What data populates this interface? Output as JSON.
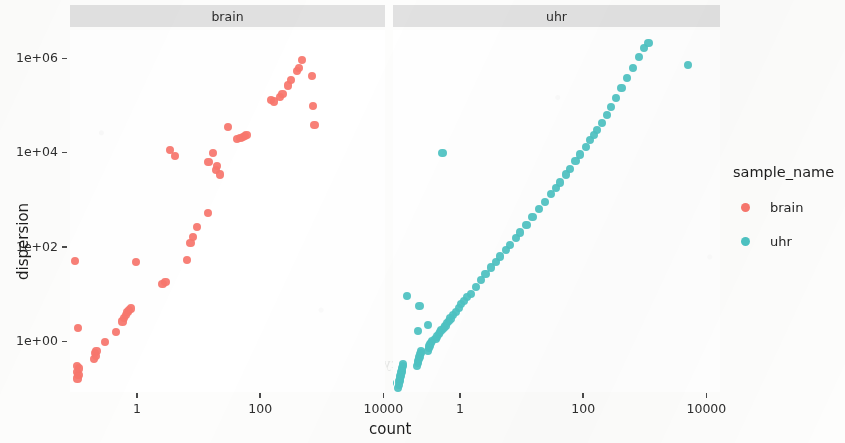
{
  "chart_data": {
    "type": "scatter",
    "title": "",
    "xlabel": "count",
    "ylabel": "dispersion",
    "xscale": "log10",
    "yscale": "log10",
    "xlim": [
      0.02,
      40000
    ],
    "ylim": [
      0.04,
      4000000
    ],
    "grid": false,
    "facet_by": "sample_name",
    "legend_title": "sample_name",
    "legend_position": "right",
    "x_ticks": [
      "1",
      "100",
      "10000"
    ],
    "x_tick_values": [
      1,
      100,
      10000
    ],
    "y_ticks": [
      "1e+00",
      "1e+02",
      "1e+04",
      "1e+06"
    ],
    "y_tick_values": [
      1,
      100,
      10000,
      1000000
    ],
    "colors": {
      "brain": "#F8766D",
      "uhr": "#4DC3C3"
    },
    "facets": [
      {
        "label": "brain",
        "series_name": "brain",
        "color": "#F8766D",
        "points": [
          [
            0.06,
            0.045
          ],
          [
            0.1,
            50.0
          ],
          [
            0.105,
            0.22
          ],
          [
            0.107,
            0.3
          ],
          [
            0.108,
            0.16
          ],
          [
            0.11,
            1.9
          ],
          [
            0.112,
            0.19
          ],
          [
            0.115,
            0.26
          ],
          [
            0.2,
            0.42
          ],
          [
            0.21,
            0.55
          ],
          [
            0.215,
            0.48
          ],
          [
            0.22,
            0.62
          ],
          [
            0.3,
            0.95
          ],
          [
            0.45,
            1.55
          ],
          [
            0.58,
            2.6
          ],
          [
            0.62,
            3.1
          ],
          [
            0.66,
            3.6
          ],
          [
            0.7,
            4.2
          ],
          [
            0.75,
            4.6
          ],
          [
            0.8,
            4.9
          ],
          [
            0.95,
            48.0
          ],
          [
            2.6,
            16.0
          ],
          [
            2.9,
            18.0
          ],
          [
            6.5,
            52.0
          ],
          [
            7.4,
            120.0
          ],
          [
            8.0,
            160.0
          ],
          [
            9.5,
            260.0
          ],
          [
            14.0,
            520.0
          ],
          [
            3.4,
            11000.0
          ],
          [
            4.2,
            8200.0
          ],
          [
            14.5,
            6300.0
          ],
          [
            17.0,
            9500.0
          ],
          [
            19.0,
            4200.0
          ],
          [
            20.0,
            5200.0
          ],
          [
            22.0,
            3400.0
          ],
          [
            30.0,
            35000.0
          ],
          [
            42.0,
            19000.0
          ],
          [
            48.0,
            20500.0
          ],
          [
            52.0,
            21000.0
          ],
          [
            56.0,
            22000.0
          ],
          [
            60.0,
            23000.0
          ],
          [
            150.0,
            130000.0
          ],
          [
            170.0,
            120000.0
          ],
          [
            210.0,
            150000.0
          ],
          [
            230.0,
            175000.0
          ],
          [
            280.0,
            260000.0
          ],
          [
            320.0,
            340000.0
          ],
          [
            390.0,
            520000.0
          ],
          [
            430.0,
            610000.0
          ],
          [
            480.0,
            900000.0
          ],
          [
            700.0,
            420000.0
          ],
          [
            730.0,
            95000.0
          ],
          [
            760.0,
            38000.0
          ]
        ]
      },
      {
        "label": "uhr",
        "series_name": "uhr",
        "color": "#4DC3C3",
        "points": [
          [
            0.055,
            0.055
          ],
          [
            0.1,
            0.1
          ],
          [
            0.102,
            0.12
          ],
          [
            0.104,
            0.14
          ],
          [
            0.106,
            0.16
          ],
          [
            0.108,
            0.18
          ],
          [
            0.11,
            0.2
          ],
          [
            0.112,
            0.22
          ],
          [
            0.114,
            0.24
          ],
          [
            0.116,
            0.27
          ],
          [
            0.118,
            0.3
          ],
          [
            0.12,
            0.33
          ],
          [
            0.2,
            0.3
          ],
          [
            0.205,
            0.34
          ],
          [
            0.21,
            0.38
          ],
          [
            0.215,
            0.42
          ],
          [
            0.22,
            0.46
          ],
          [
            0.225,
            0.52
          ],
          [
            0.23,
            0.56
          ],
          [
            0.235,
            0.6
          ],
          [
            0.3,
            0.62
          ],
          [
            0.31,
            0.7
          ],
          [
            0.32,
            0.78
          ],
          [
            0.33,
            0.85
          ],
          [
            0.34,
            0.92
          ],
          [
            0.35,
            1.0
          ],
          [
            0.4,
            1.1
          ],
          [
            0.42,
            1.25
          ],
          [
            0.45,
            1.4
          ],
          [
            0.48,
            1.55
          ],
          [
            0.5,
            1.7
          ],
          [
            0.55,
            1.9
          ],
          [
            0.58,
            2.1
          ],
          [
            0.62,
            2.4
          ],
          [
            0.66,
            2.7
          ],
          [
            0.7,
            3.0
          ],
          [
            0.78,
            3.6
          ],
          [
            0.85,
            4.2
          ],
          [
            0.95,
            5.0
          ],
          [
            1.05,
            6.0
          ],
          [
            1.15,
            7.0
          ],
          [
            1.3,
            8.5
          ],
          [
            1.5,
            10.0
          ],
          [
            1.8,
            14.0
          ],
          [
            2.2,
            20.0
          ],
          [
            2.6,
            26.0
          ],
          [
            3.2,
            36.0
          ],
          [
            3.8,
            48.0
          ],
          [
            4.5,
            62.0
          ],
          [
            5.5,
            85.0
          ],
          [
            6.5,
            110.0
          ],
          [
            8.0,
            150.0
          ],
          [
            9.5,
            200.0
          ],
          [
            12.0,
            290.0
          ],
          [
            15.0,
            420.0
          ],
          [
            19.0,
            620.0
          ],
          [
            24.0,
            900.0
          ],
          [
            30.0,
            1300.0
          ],
          [
            36.0,
            1750.0
          ],
          [
            42.0,
            2300.0
          ],
          [
            52.0,
            3400.0
          ],
          [
            62.0,
            4500.0
          ],
          [
            75.0,
            6500.0
          ],
          [
            90.0,
            9000.0
          ],
          [
            110.0,
            13000.0
          ],
          [
            130.0,
            18000.0
          ],
          [
            150.0,
            23000.0
          ],
          [
            170.0,
            30000.0
          ],
          [
            200.0,
            42000.0
          ],
          [
            240.0,
            62000.0
          ],
          [
            280.0,
            90000.0
          ],
          [
            340.0,
            140000.0
          ],
          [
            420.0,
            230000.0
          ],
          [
            520.0,
            380000.0
          ],
          [
            640.0,
            620000.0
          ],
          [
            800.0,
            1050000.0
          ],
          [
            980.0,
            1600000.0
          ],
          [
            1150.0,
            2100000.0
          ],
          [
            0.14,
            9.0
          ],
          [
            0.21,
            1.6
          ],
          [
            0.22,
            5.5
          ],
          [
            0.3,
            2.2
          ],
          [
            0.52,
            9500.0
          ],
          [
            0.065,
            0.09
          ],
          [
            0.07,
            0.11
          ],
          [
            0.072,
            0.13
          ],
          [
            5000.0,
            700000.0
          ]
        ]
      }
    ]
  },
  "axes": {
    "y_title": "dispersion",
    "x_title": "count"
  },
  "legend": {
    "title": "sample_name",
    "items": [
      {
        "label": "brain",
        "color": "#F8766D"
      },
      {
        "label": "uhr",
        "color": "#4DC3C3"
      }
    ]
  },
  "ghost_text": [
    {
      "text": "Represents the read counts",
      "x": 410,
      "y": 172,
      "size": 15
    },
    {
      "text": "ents the read counts",
      "x": 95,
      "y": 180,
      "size": 15
    },
    {
      "text": "is a relative measure of the dispersion",
      "x": 100,
      "y": 232,
      "size": 14
    },
    {
      "text": "in RNA-seq",
      "x": 98,
      "y": 268,
      "size": 14
    },
    {
      "text": "sion efficiency and cost",
      "x": 330,
      "y": 356,
      "size": 14
    },
    {
      "text": "resulting",
      "x": 105,
      "y": 355,
      "size": 14
    }
  ]
}
